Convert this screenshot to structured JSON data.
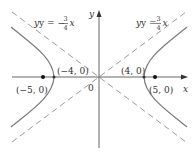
{
  "diagram": {
    "type": "hyperbola",
    "equation_parameters": {
      "a": 4,
      "b": 3,
      "c": 5
    },
    "axes": {
      "x_label": "x",
      "y_label": "y",
      "origin_label": "0"
    },
    "asymptotes": [
      {
        "label_prefix": "y = −",
        "num": "3",
        "den": "4",
        "var": "x",
        "slope": -0.75
      },
      {
        "label_prefix": "y = ",
        "num": "3",
        "den": "4",
        "var": "x",
        "slope": 0.75
      }
    ],
    "points": [
      {
        "label": "(−5, 0)",
        "role": "focus"
      },
      {
        "label": "(−4, 0)",
        "role": "vertex"
      },
      {
        "label": "(4, 0)",
        "role": "vertex"
      },
      {
        "label": "(5, 0)",
        "role": "focus"
      }
    ],
    "colors": {
      "curve": "#7a7a7a",
      "asymptote": "#9a9a9a",
      "axis": "#555555",
      "text": "#333333"
    }
  }
}
